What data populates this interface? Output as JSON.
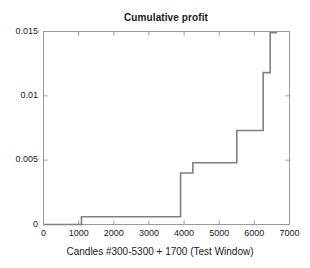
{
  "chart_data": {
    "type": "line",
    "subtype": "step",
    "title": "Cumulative profit",
    "xlabel": "Candles #300-5300 + 1700 (Test Window)",
    "ylabel": "",
    "xlim": [
      0,
      7000
    ],
    "ylim": [
      0,
      0.015
    ],
    "grid": false,
    "legend": null,
    "xticks": [
      0,
      1000,
      2000,
      3000,
      4000,
      5000,
      6000,
      7000
    ],
    "xtick_labels": [
      "0",
      "1000",
      "2000",
      "3000",
      "4000",
      "5000",
      "6000",
      "7000"
    ],
    "yticks": [
      0,
      0.005,
      0.01,
      0.015
    ],
    "ytick_labels": [
      "0",
      "0.005",
      "0.01",
      "0.015"
    ],
    "line_color": "#808080",
    "line_width": 1.6,
    "x": [
      0,
      1080,
      1080,
      3900,
      3900,
      4250,
      4250,
      5500,
      5500,
      6250,
      6250,
      6450,
      6450,
      6650
    ],
    "y": [
      0,
      0,
      0.0006,
      0.0006,
      0.004,
      0.004,
      0.0048,
      0.0048,
      0.0073,
      0.0073,
      0.0118,
      0.0118,
      0.0149,
      0.0149
    ],
    "steps": [
      {
        "x_start": 0,
        "x_end": 1080,
        "value": 0
      },
      {
        "x_start": 1080,
        "x_end": 3900,
        "value": 0.0006
      },
      {
        "x_start": 3900,
        "x_end": 4250,
        "value": 0.004
      },
      {
        "x_start": 4250,
        "x_end": 5500,
        "value": 0.0048
      },
      {
        "x_start": 5500,
        "x_end": 6250,
        "value": 0.0073
      },
      {
        "x_start": 6250,
        "x_end": 6450,
        "value": 0.0118
      },
      {
        "x_start": 6450,
        "x_end": 6650,
        "value": 0.0149
      }
    ]
  },
  "figure": {
    "title": "Cumulative profit",
    "xlabel": "Candles #300-5300 + 1700 (Test Window)",
    "background": "#ffffff",
    "axes_color": "#9a9a9a"
  },
  "yticks": [
    {
      "label": "0.015"
    },
    {
      "label": "0.01"
    },
    {
      "label": "0.005"
    },
    {
      "label": "0"
    }
  ],
  "xticks": [
    {
      "label": "0"
    },
    {
      "label": "1000"
    },
    {
      "label": "2000"
    },
    {
      "label": "3000"
    },
    {
      "label": "4000"
    },
    {
      "label": "5000"
    },
    {
      "label": "6000"
    },
    {
      "label": "7000"
    }
  ]
}
